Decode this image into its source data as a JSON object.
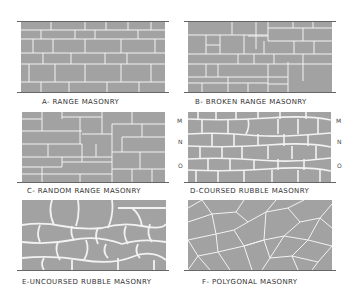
{
  "panels": [
    {
      "id": "A",
      "label": "A- RANGE MASONRY"
    },
    {
      "id": "B",
      "label": "B- BROKEN RANGE MASONRY"
    },
    {
      "id": "C",
      "label": "C- RANDOM RANGE MASONRY"
    },
    {
      "id": "D",
      "label": "D-COURSED RUBBLE MASONRY"
    },
    {
      "id": "E",
      "label": "E-UNCOURSED RUBBLE MASONRY"
    },
    {
      "id": "F",
      "label": "F- POLYGONAL MASONRY"
    }
  ],
  "course_markers": {
    "m": "M",
    "n": "N",
    "o": "O"
  },
  "colors": {
    "stone": "#a2a2a2",
    "joint": "#f2f2f2",
    "background": "#ffffff",
    "text": "#333333"
  }
}
